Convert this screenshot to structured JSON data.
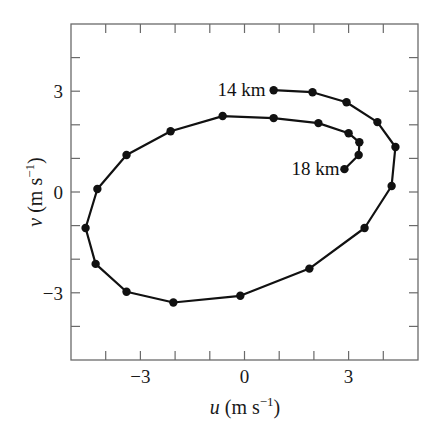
{
  "chart_data": {
    "type": "line",
    "title": "",
    "xlabel": "u (m s⁻¹)",
    "ylabel": "v (m s⁻¹)",
    "xlabel_parts": {
      "var": "u",
      "unit": "(m s",
      "sup": "−1",
      "close": ")"
    },
    "ylabel_parts": {
      "var": "v",
      "unit": "(m s",
      "sup": "−1",
      "close": ")"
    },
    "xlim": [
      -5,
      5
    ],
    "ylim": [
      -5,
      5
    ],
    "x_ticks": [
      -5,
      -4,
      -3,
      -2,
      -1,
      0,
      1,
      2,
      3,
      4,
      5
    ],
    "y_ticks": [
      -5,
      -4,
      -3,
      -2,
      -1,
      0,
      1,
      2,
      3,
      4,
      5
    ],
    "x_tick_labels": [
      {
        "value": -3,
        "label": "−3"
      },
      {
        "value": 0,
        "label": "0"
      },
      {
        "value": 3,
        "label": "3"
      }
    ],
    "y_tick_labels": [
      {
        "value": 3,
        "label": "3"
      },
      {
        "value": 0,
        "label": "0"
      },
      {
        "value": -3,
        "label": "−3"
      }
    ],
    "grid": false,
    "legend": null,
    "series": [
      {
        "name": "hodograph",
        "color": "#111111",
        "marker": "circle",
        "u": [
          0.84,
          1.96,
          2.94,
          3.83,
          4.35,
          4.24,
          3.46,
          1.87,
          -0.12,
          -2.05,
          -3.4,
          -4.29,
          -4.58,
          -4.24,
          -3.4,
          -2.13,
          -0.63,
          0.84,
          2.13,
          3.0,
          3.31,
          3.29,
          2.88
        ],
        "v": [
          3.03,
          2.97,
          2.67,
          2.08,
          1.34,
          0.18,
          -1.07,
          -2.28,
          -3.09,
          -3.29,
          -2.97,
          -2.14,
          -1.07,
          0.09,
          1.1,
          1.81,
          2.26,
          2.2,
          2.05,
          1.75,
          1.48,
          1.1,
          0.68
        ]
      }
    ],
    "annotations": [
      {
        "text": "14 km",
        "u": 0.84,
        "v": 3.03,
        "anchor": "end",
        "dx": -8,
        "dy": 6
      },
      {
        "text": "18 km",
        "u": 2.88,
        "v": 0.68,
        "anchor": "end",
        "dx": -5,
        "dy": 6
      }
    ]
  }
}
